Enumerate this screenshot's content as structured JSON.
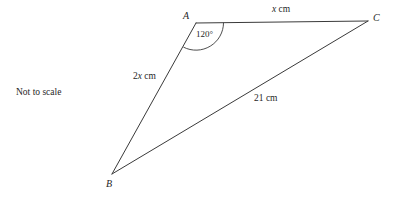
{
  "figure": {
    "note": "Not to scale",
    "stroke_color": "#3a3a3a",
    "text_color": "#1f1f1f",
    "background_color": "#ffffff",
    "vertices": [
      {
        "name": "A",
        "label": "A",
        "x": 196,
        "y": 23
      },
      {
        "name": "B",
        "label": "B",
        "x": 112,
        "y": 174
      },
      {
        "name": "C",
        "label": "C",
        "x": 368,
        "y": 21
      }
    ],
    "sides": [
      {
        "name": "AC",
        "label": "x cm",
        "value": "x",
        "unit": "cm",
        "from": "A",
        "to": "C"
      },
      {
        "name": "AB",
        "label": "2x cm",
        "value": "2x",
        "unit": "cm",
        "from": "A",
        "to": "B"
      },
      {
        "name": "BC",
        "label": "21 cm",
        "value": "21",
        "unit": "cm",
        "from": "B",
        "to": "C"
      }
    ],
    "angles": [
      {
        "name": "angle-BAC",
        "at": "A",
        "label": "120°",
        "degrees": 120
      }
    ]
  }
}
